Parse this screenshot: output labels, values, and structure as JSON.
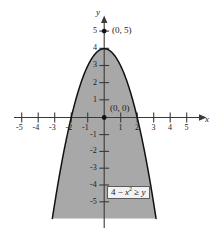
{
  "figure": {
    "background_color": "#ffffff",
    "axis_color": "#3a3a3a",
    "curve_color": "#111111",
    "shade_color": "#a8a8a8",
    "label_color": "#1a1a1a"
  },
  "axes": {
    "x_axis_name": "x",
    "y_axis_name": "y",
    "x_ticks": [
      "-5",
      "-4",
      "-3",
      "-2",
      "-1",
      "1",
      "2",
      "3",
      "4",
      "5"
    ],
    "y_ticks": [
      "5",
      "4",
      "3",
      "2",
      "1",
      "-1",
      "-2",
      "-3",
      "-4",
      "-5"
    ],
    "xlim": [
      -5.8,
      6.5
    ],
    "ylim": [
      -6.1,
      5.9
    ]
  },
  "annotations": {
    "point_top_label": "(0, 5)",
    "point_origin_label": "(0, 0)",
    "inequality_prefix": "4 ",
    "inequality_minus": "− ",
    "inequality_var": "x",
    "inequality_exp": "2",
    "inequality_relation": " ≥ ",
    "inequality_rhs": "y"
  },
  "chart_data": {
    "type": "line",
    "title": "",
    "xlabel": "x",
    "ylabel": "y",
    "xlim": [
      -5.8,
      6.5
    ],
    "ylim": [
      -6.1,
      5.9
    ],
    "grid": false,
    "legend": "none",
    "series": [
      {
        "name": "y = 4 - x^2",
        "equation": "y = 4 − x²",
        "vertex": [
          0,
          4
        ],
        "x_intercepts": [
          -2,
          2
        ],
        "x": [
          -3.2,
          -3.0,
          -2.5,
          -2.0,
          -1.5,
          -1.0,
          -0.5,
          0.0,
          0.5,
          1.0,
          1.5,
          2.0,
          2.5,
          3.0,
          3.2
        ],
        "y": [
          -6.24,
          -5.0,
          -2.25,
          0.0,
          1.75,
          3.0,
          3.75,
          4.0,
          3.75,
          3.0,
          1.75,
          0.0,
          -2.25,
          -5.0,
          -6.24
        ]
      }
    ],
    "shaded_region": {
      "label": "4 − x² ≥ y",
      "description": "Region below and inside the parabola y = 4 - x^2",
      "color": "#a8a8a8"
    },
    "points": [
      {
        "label": "(0, 5)",
        "x": 0,
        "y": 5,
        "marker": "filled-dot"
      },
      {
        "label": "(0, 0)",
        "x": 0,
        "y": 0,
        "marker": "filled-dot"
      }
    ]
  }
}
